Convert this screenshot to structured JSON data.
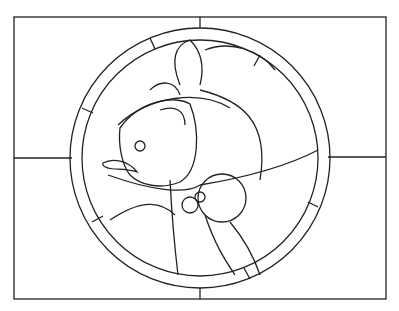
{
  "image": {
    "subject": "stained glass pattern: fish inside circular border on rectangular panel",
    "stroke_color": "#222222",
    "background": "#ffffff"
  }
}
